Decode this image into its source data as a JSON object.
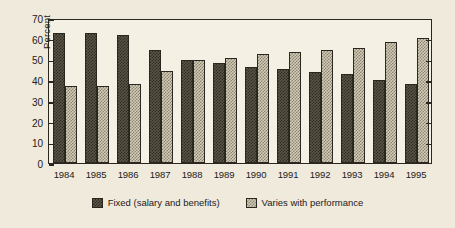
{
  "chart_data": {
    "type": "bar",
    "title": "",
    "xlabel": "",
    "ylabel": "Percent",
    "ylim": [
      0,
      70
    ],
    "yticks": [
      0,
      10,
      20,
      30,
      40,
      50,
      60,
      70
    ],
    "grid": false,
    "legend_position": "bottom-center",
    "categories": [
      "1984",
      "1985",
      "1986",
      "1987",
      "1988",
      "1989",
      "1990",
      "1991",
      "1992",
      "1993",
      "1994",
      "1995"
    ],
    "series": [
      {
        "name": "Fixed (salary and benefits)",
        "color": "#3a352c",
        "values": [
          63,
          63,
          62,
          54.5,
          49.5,
          48.5,
          46.5,
          45.5,
          44,
          43,
          40,
          38
        ]
      },
      {
        "name": "Varies with performance",
        "color": "#c4beab",
        "values": [
          37,
          37,
          38,
          44.5,
          49.5,
          50.5,
          52.5,
          53.5,
          54.5,
          55.5,
          58.5,
          60.5
        ]
      }
    ]
  },
  "legend": {
    "items": [
      {
        "label": "Fixed (salary and benefits)",
        "swatch": "dark-dither-swatch"
      },
      {
        "label": "Varies with performance",
        "swatch": "light-dither-swatch"
      }
    ]
  },
  "colors": {
    "background": "#efeadc",
    "plot_background": "#f4f0e3",
    "axis": "#2a2620",
    "series_fixed": "#3a352c",
    "series_varies": "#c4beab"
  }
}
